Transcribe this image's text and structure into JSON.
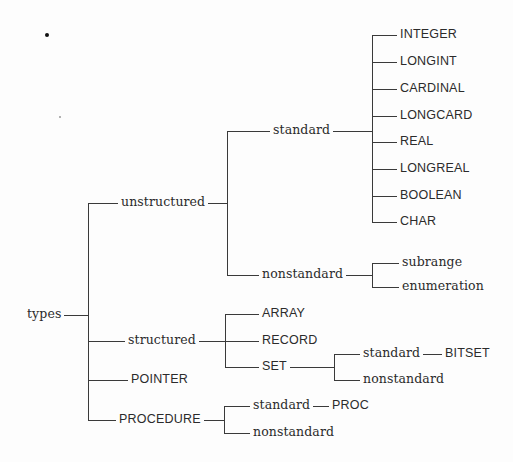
{
  "diagram": {
    "type": "tree",
    "colors": {
      "line": "#3a3a3a",
      "text": "#2b2b2b",
      "background": "#fdfdfd"
    },
    "root": {
      "label": "types",
      "children": [
        {
          "label": "unstructured",
          "children": [
            {
              "label": "standard",
              "children": [
                {
                  "label": "INTEGER"
                },
                {
                  "label": "LONGINT"
                },
                {
                  "label": "CARDINAL"
                },
                {
                  "label": "LONGCARD"
                },
                {
                  "label": "REAL"
                },
                {
                  "label": "LONGREAL"
                },
                {
                  "label": "BOOLEAN"
                },
                {
                  "label": "CHAR"
                }
              ]
            },
            {
              "label": "nonstandard",
              "children": [
                {
                  "label": "subrange"
                },
                {
                  "label": "enumeration"
                }
              ]
            }
          ]
        },
        {
          "label": "structured",
          "children": [
            {
              "label": "ARRAY"
            },
            {
              "label": "RECORD"
            },
            {
              "label": "SET",
              "children": [
                {
                  "label": "standard",
                  "children": [
                    {
                      "label": "BITSET"
                    }
                  ]
                },
                {
                  "label": "nonstandard"
                }
              ]
            }
          ]
        },
        {
          "label": "POINTER"
        },
        {
          "label": "PROCEDURE",
          "children": [
            {
              "label": "standard",
              "children": [
                {
                  "label": "PROC"
                }
              ]
            },
            {
              "label": "nonstandard"
            }
          ]
        }
      ]
    }
  },
  "labels": {
    "types": "types",
    "unstructured": "unstructured",
    "unstructured_standard": "standard",
    "integer": "INTEGER",
    "longint": "LONGINT",
    "cardinal": "CARDINAL",
    "longcard": "LONGCARD",
    "real": "REAL",
    "longreal": "LONGREAL",
    "boolean": "BOOLEAN",
    "char": "CHAR",
    "unstructured_nonstandard": "nonstandard",
    "subrange": "subrange",
    "enumeration": "enumeration",
    "structured": "structured",
    "array": "ARRAY",
    "record": "RECORD",
    "set": "SET",
    "set_standard": "standard",
    "bitset": "BITSET",
    "set_nonstandard": "nonstandard",
    "pointer": "POINTER",
    "procedure": "PROCEDURE",
    "procedure_standard": "standard",
    "proc": "PROC",
    "procedure_nonstandard": "nonstandard"
  }
}
